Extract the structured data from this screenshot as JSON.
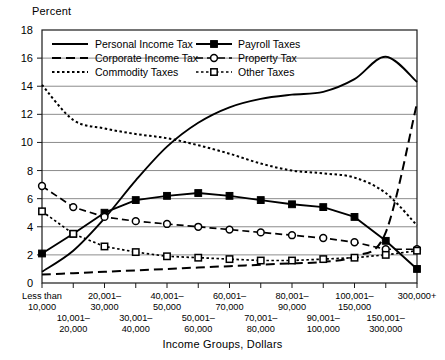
{
  "chart_data": {
    "type": "line",
    "title": "",
    "ylabel": "Percent",
    "xlabel": "Income Groups, Dollars",
    "ylim": [
      0,
      18
    ],
    "ytick_step": 2,
    "yticks": [
      "0",
      "2",
      "4",
      "6",
      "8",
      "10",
      "12",
      "14",
      "16",
      "18"
    ],
    "grid": true,
    "legend_position": "top-left-inside",
    "categories": [
      "Less than 10,000",
      "10,001–20,000",
      "20,001–30,000",
      "30,001–40,000",
      "40,001–50,000",
      "50,001–60,000",
      "60,001–70,000",
      "70,001–80,000",
      "80,001–90,000",
      "90,001–100,000",
      "100,001–150,000",
      "150,001–300,000",
      "300,000+"
    ],
    "categories_top_row": [
      "Less than\n10,000",
      "",
      "20,001–\n30,000",
      "",
      "40,001–\n50,000",
      "",
      "60,001–\n70,000",
      "",
      "80,001–\n90,000",
      "",
      "100,001–\n150,000",
      "",
      "300,000+"
    ],
    "categories_bottom_row": [
      "",
      "10,001–\n20,000",
      "",
      "30,001–\n40,000",
      "",
      "50,001–\n60,000",
      "",
      "70,001–\n80,000",
      "",
      "90,001–\n100,000",
      "",
      "150,001–\n300,000",
      ""
    ],
    "series": [
      {
        "name": "Personal Income Tax",
        "style": "solid",
        "marker": "none",
        "values": [
          0.8,
          2.3,
          4.6,
          7.3,
          9.7,
          11.4,
          12.5,
          13.1,
          13.4,
          13.6,
          14.5,
          16.1,
          14.3
        ]
      },
      {
        "name": "Corporate Income Tax",
        "style": "long-dash",
        "marker": "none",
        "values": [
          0.6,
          0.7,
          0.8,
          0.9,
          1.0,
          1.1,
          1.2,
          1.3,
          1.4,
          1.5,
          1.9,
          3.6,
          12.8
        ]
      },
      {
        "name": "Commodity Taxes",
        "style": "dotted",
        "marker": "none",
        "values": [
          14.1,
          11.6,
          11.0,
          10.6,
          10.3,
          9.8,
          9.2,
          8.5,
          8.0,
          7.8,
          7.5,
          6.4,
          4.1
        ]
      },
      {
        "name": "Payroll Taxes",
        "style": "solid",
        "marker": "filled-square",
        "values": [
          2.1,
          3.5,
          5.0,
          5.9,
          6.2,
          6.4,
          6.2,
          5.9,
          5.6,
          5.4,
          4.7,
          3.0,
          1.0
        ]
      },
      {
        "name": "Property Tax",
        "style": "dash",
        "marker": "open-circle",
        "values": [
          6.9,
          5.4,
          4.7,
          4.4,
          4.2,
          4.0,
          3.8,
          3.6,
          3.4,
          3.2,
          2.9,
          2.4,
          2.4
        ]
      },
      {
        "name": "Other Taxes",
        "style": "dotted",
        "marker": "open-square",
        "values": [
          5.1,
          3.5,
          2.6,
          2.2,
          1.9,
          1.8,
          1.7,
          1.6,
          1.6,
          1.7,
          1.8,
          2.0,
          2.3
        ]
      }
    ]
  },
  "colors": {
    "ink": "#000000",
    "grid": "#6e6e6e",
    "background": "#ffffff"
  }
}
